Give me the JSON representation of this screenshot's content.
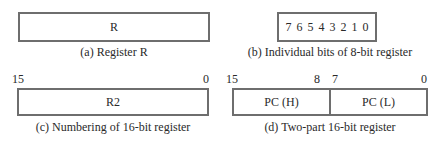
{
  "panels": {
    "a": {
      "box_label": "R",
      "caption": "(a) Register R"
    },
    "b": {
      "bits": [
        "7",
        "6",
        "5",
        "4",
        "3",
        "2",
        "1",
        "0"
      ],
      "caption": "(b) Individual bits of 8-bit register"
    },
    "c": {
      "box_label": "R2",
      "left_index": "15",
      "right_index": "0",
      "caption": "(c) Numbering of 16-bit register"
    },
    "d": {
      "high_label": "PC (H)",
      "low_label": "PC (L)",
      "index_15": "15",
      "index_8": "8",
      "index_7": "7",
      "index_0": "0",
      "caption": "(d) Two-part 16-bit register"
    }
  },
  "colors": {
    "border": "#6e6e6e",
    "text": "#2a2a2a",
    "background": "#ffffff"
  }
}
